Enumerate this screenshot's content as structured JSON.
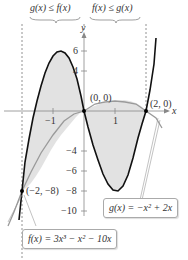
{
  "header": {
    "left_region": "g(x) ≤ f(x)",
    "right_region": "f(x) ≤ g(x)"
  },
  "axes": {
    "x_label": "x",
    "y_label": "y",
    "x_ticks": [
      "−1",
      "1"
    ],
    "y_ticks": [
      "6",
      "4",
      "−4",
      "−6",
      "−8",
      "−10"
    ]
  },
  "points": [
    {
      "label": "(0, 0)",
      "x": 0,
      "y": 0
    },
    {
      "label": "(2, 0)",
      "x": 2,
      "y": 0
    },
    {
      "label": "(−2, −8)",
      "x": -2,
      "y": -8
    }
  ],
  "functions": {
    "f": "f(x) = 3x³ − x² − 10x",
    "g": "g(x) = −x² + 2x"
  },
  "colors": {
    "f_curve": "#111111",
    "g_curve": "#999999",
    "shade": "#e0e0e0",
    "axis": "#888888"
  }
}
